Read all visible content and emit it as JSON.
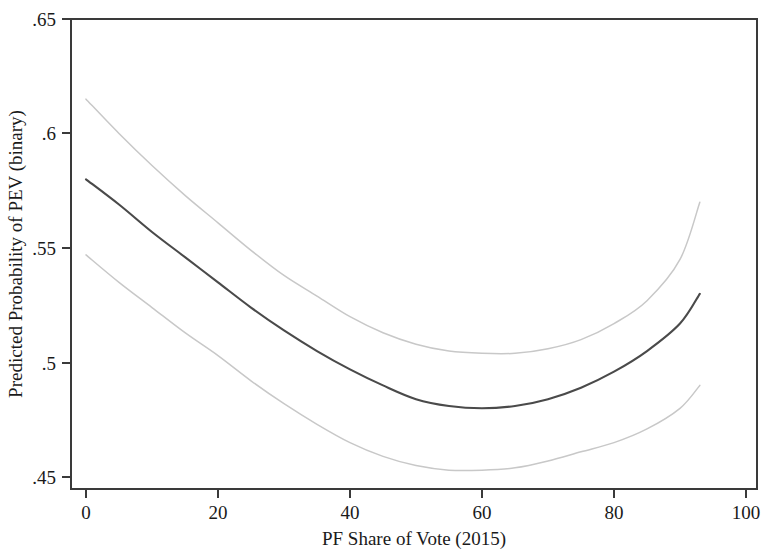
{
  "chart_data": {
    "type": "line",
    "title": "",
    "subtitle": "",
    "xlabel": "PF Share of Vote (2015)",
    "ylabel": "Predicted Probability of PEV (binary)",
    "xlim": [
      0,
      100
    ],
    "ylim": [
      0.45,
      0.65
    ],
    "xticks": [
      0,
      20,
      40,
      60,
      80,
      100
    ],
    "xtick_labels": [
      "0",
      "20",
      "40",
      "60",
      "80",
      "100"
    ],
    "yticks": [
      0.45,
      0.5,
      0.55,
      0.6,
      0.65
    ],
    "ytick_labels": [
      ".45",
      ".5",
      ".55",
      ".6",
      ".65"
    ],
    "grid": false,
    "legend": "none",
    "annotations": [],
    "x": [
      0,
      5,
      10,
      15,
      20,
      25,
      30,
      35,
      40,
      45,
      50,
      55,
      60,
      65,
      70,
      75,
      80,
      85,
      90,
      93
    ],
    "series": [
      {
        "name": "Upper 95% CI",
        "color": "#c8c8c8",
        "style": "thin",
        "values": [
          0.615,
          0.6,
          0.586,
          0.573,
          0.561,
          0.549,
          0.538,
          0.529,
          0.52,
          0.513,
          0.508,
          0.505,
          0.504,
          0.504,
          0.506,
          0.51,
          0.517,
          0.527,
          0.545,
          0.57
        ]
      },
      {
        "name": "Predicted probability",
        "color": "#4a4a4a",
        "style": "thick",
        "values": [
          0.58,
          0.569,
          0.557,
          0.546,
          0.535,
          0.524,
          0.514,
          0.505,
          0.497,
          0.49,
          0.484,
          0.481,
          0.48,
          0.481,
          0.484,
          0.489,
          0.496,
          0.505,
          0.517,
          0.53
        ]
      },
      {
        "name": "Lower 95% CI",
        "color": "#c8c8c8",
        "style": "thin",
        "values": [
          0.547,
          0.535,
          0.524,
          0.513,
          0.503,
          0.492,
          0.482,
          0.473,
          0.465,
          0.459,
          0.455,
          0.453,
          0.453,
          0.454,
          0.457,
          0.461,
          0.465,
          0.471,
          0.48,
          0.49
        ]
      }
    ],
    "minimum": {
      "x": 53,
      "y": 0.48
    }
  },
  "axes": {
    "x_title": "PF Share of Vote (2015)",
    "y_title": "Predicted Probability of PEV (binary)",
    "x_labels": [
      "0",
      "20",
      "40",
      "60",
      "80",
      "100"
    ],
    "y_labels": [
      ".45",
      ".5",
      ".55",
      ".6",
      ".65"
    ]
  },
  "colors": {
    "main_line": "#4a4a4a",
    "ci_line": "#c8c8c8",
    "frame": "#3a3a3a",
    "background": "#ffffff",
    "text": "#1a1a1a"
  }
}
